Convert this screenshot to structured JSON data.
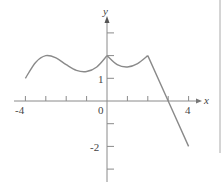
{
  "chart_data": {
    "type": "line",
    "title": "",
    "xlabel": "x",
    "ylabel": "y",
    "xlim": [
      -4,
      4
    ],
    "ylim": [
      -3,
      3
    ],
    "x_tick_labels": [
      "-4",
      "0",
      "4"
    ],
    "y_tick_labels": [
      "1",
      "-2"
    ],
    "x_ticks": [
      -4,
      -3,
      -2,
      -1,
      1,
      2,
      3,
      4
    ],
    "y_ticks": [
      3,
      2,
      1,
      -1,
      -2,
      -3
    ],
    "grid": false,
    "series": [
      {
        "name": "f(x)",
        "points": [
          [
            -4,
            1.0
          ],
          [
            -3.5,
            1.7
          ],
          [
            -3,
            2.0
          ],
          [
            -2.5,
            1.9
          ],
          [
            -2,
            1.6
          ],
          [
            -1.5,
            1.35
          ],
          [
            -1,
            1.3
          ],
          [
            -0.5,
            1.5
          ],
          [
            0,
            2.0
          ],
          [
            0.5,
            1.6
          ],
          [
            1,
            1.5
          ],
          [
            1.5,
            1.65
          ],
          [
            2,
            2.0
          ],
          [
            3,
            0.0
          ],
          [
            4,
            -2.0
          ]
        ],
        "color": "#8a8a8a",
        "features": {
          "cusp": [
            0,
            2
          ],
          "corner": [
            2,
            2
          ],
          "x_intercept": 3
        }
      }
    ]
  },
  "labels": {
    "x_axis": "x",
    "y_axis": "y",
    "x_neg4": "-4",
    "x_0": "0",
    "x_4": "4",
    "y_1": "1",
    "y_neg2": "-2"
  },
  "colors": {
    "axis": "#8a8a8a",
    "curve": "#8a8a8a",
    "text": "#444444"
  }
}
